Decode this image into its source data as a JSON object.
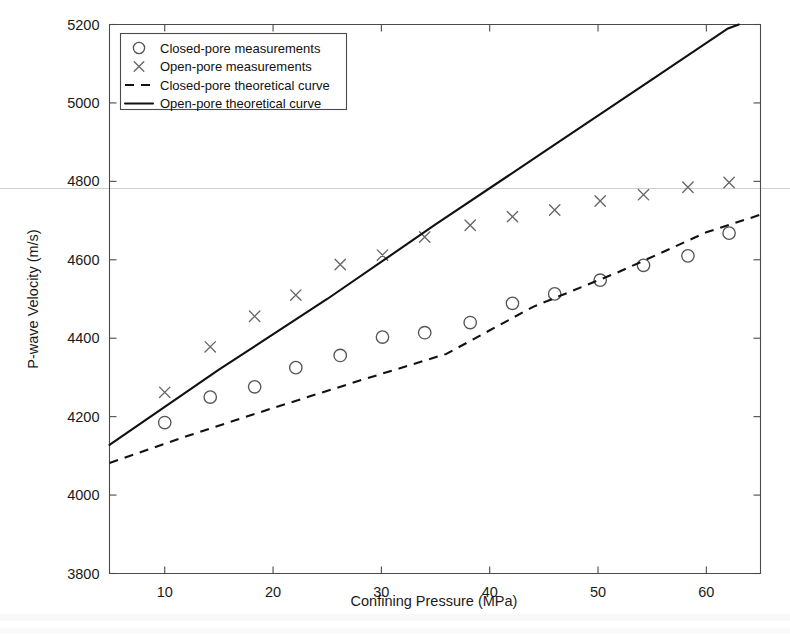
{
  "chart_data": {
    "type": "scatter",
    "title": "",
    "xlabel": "Confining Pressure (MPa)",
    "ylabel": "P-wave Velocity (m/s)",
    "xlim": [
      4.9,
      65.0
    ],
    "ylim": [
      3800,
      5200
    ],
    "xticks": [
      10,
      20,
      30,
      40,
      50,
      60
    ],
    "xtick_labels": [
      "10",
      "20",
      "30",
      "40",
      "50",
      "60"
    ],
    "yticks": [
      3800,
      4000,
      4200,
      4400,
      4600,
      4800,
      5000,
      5200
    ],
    "ytick_labels": [
      "3800",
      "4000",
      "4200",
      "4400",
      "4600",
      "4800",
      "5000",
      "5200"
    ],
    "grid": false,
    "legend_position": "upper-left",
    "series": [
      {
        "name": "Closed-pore measurements",
        "marker": "circle",
        "style": "markers",
        "x": [
          10.0,
          14.2,
          18.3,
          22.1,
          26.2,
          30.1,
          34.0,
          38.2,
          42.1,
          46.0,
          50.2,
          54.2,
          58.3,
          62.1
        ],
        "y": [
          4185,
          4250,
          4276,
          4325,
          4356,
          4403,
          4414,
          4440,
          4489,
          4513,
          4548,
          4586,
          4610,
          4668
        ]
      },
      {
        "name": "Open-pore measurements",
        "marker": "cross",
        "style": "markers",
        "x": [
          10.0,
          14.2,
          18.3,
          22.1,
          26.2,
          30.1,
          34.0,
          38.2,
          42.1,
          46.0,
          50.2,
          54.2,
          58.3,
          62.1
        ],
        "y": [
          4262,
          4378,
          4456,
          4510,
          4588,
          4612,
          4658,
          4688,
          4710,
          4727,
          4750,
          4766,
          4785,
          4797
        ]
      },
      {
        "name": "Closed-pore theoretical curve",
        "marker": "none",
        "style": "dashed-line",
        "x": [
          4.9,
          12.0,
          20.0,
          28.0,
          36.0,
          44.0,
          52.0,
          60.0,
          65.0
        ],
        "y": [
          4082,
          4150,
          4222,
          4292,
          4360,
          4480,
          4570,
          4670,
          4715
        ]
      },
      {
        "name": "Open-pore theoretical curve",
        "marker": "none",
        "style": "solid-line",
        "x": [
          4.9,
          15.0,
          25.0,
          35.0,
          45.0,
          55.0,
          62.0,
          63.0
        ],
        "y": [
          4128,
          4320,
          4500,
          4690,
          4875,
          5060,
          5190,
          5200
        ]
      }
    ],
    "legend": [
      {
        "label": "Closed-pore measurements",
        "marker": "circle"
      },
      {
        "label": "Open-pore measurements",
        "marker": "cross"
      },
      {
        "label": "Closed-pore theoretical curve",
        "marker": "dashed"
      },
      {
        "label": "Open-pore theoretical curve",
        "marker": "solid"
      }
    ]
  }
}
